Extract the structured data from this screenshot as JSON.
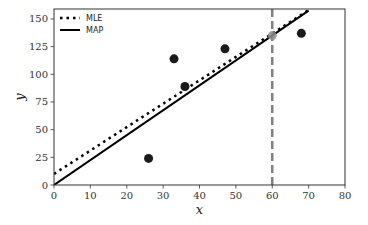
{
  "chart_data": {
    "type": "scatter",
    "title": "",
    "xlabel": "x",
    "ylabel": "y",
    "xlim": [
      0,
      80
    ],
    "ylim": [
      0,
      159
    ],
    "xticks": [
      0,
      10,
      20,
      30,
      40,
      50,
      60,
      70,
      80
    ],
    "yticks": [
      0,
      25,
      50,
      75,
      100,
      125,
      150
    ],
    "grid": false,
    "legend_position": "upper left",
    "legend": [
      {
        "label": "MLE",
        "style": "dotted",
        "color": "#000000"
      },
      {
        "label": "MAP",
        "style": "solid",
        "color": "#000000"
      }
    ],
    "scatter_points": {
      "color": "#1a1a1a",
      "x": [
        26,
        33,
        36,
        47,
        68
      ],
      "y": [
        24,
        114,
        89,
        123,
        137
      ]
    },
    "lines": [
      {
        "name": "MLE",
        "style": "dotted",
        "x": [
          0,
          70
        ],
        "y": [
          10,
          158
        ],
        "intercept": 10,
        "slope": 2.11
      },
      {
        "name": "MAP",
        "style": "solid",
        "x": [
          0,
          70
        ],
        "y": [
          0,
          157.5
        ],
        "intercept": 0,
        "slope": 2.25
      }
    ],
    "vertical_line": {
      "x": 60,
      "style": "dashed",
      "color": "#808080"
    },
    "prediction_point": {
      "x": 60,
      "y": 135,
      "color": "#909090"
    }
  }
}
